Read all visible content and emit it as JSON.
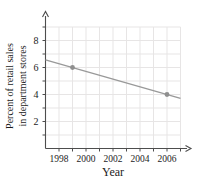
{
  "chart": {
    "ylabel_lines": [
      "Percent of retail sales",
      "in department stores"
    ],
    "xlabel": "Year"
  },
  "chart_data": {
    "type": "line",
    "title": "",
    "xlabel": "Year",
    "ylabel": "Percent of retail sales in department stores",
    "xlim": [
      1997,
      2007
    ],
    "ylim": [
      0,
      9
    ],
    "x_ticks": [
      1998,
      2000,
      2002,
      2004,
      2006
    ],
    "y_ticks": [
      2,
      4,
      6,
      8
    ],
    "grid": true,
    "grid_step_x": 1,
    "grid_step_y": 1,
    "legend": "none",
    "trend_line": {
      "x": [
        1997,
        2007
      ],
      "y": [
        6.57,
        3.71
      ]
    },
    "points": [
      {
        "x": 1999,
        "y": 6
      },
      {
        "x": 2006,
        "y": 4
      }
    ],
    "colors": {
      "line": "#999999",
      "point": "#8f8f8f",
      "grid": "#e7e5e5",
      "axis": "#4d4d4d",
      "text": "#1c1c1c"
    }
  }
}
